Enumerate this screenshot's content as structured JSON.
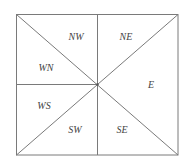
{
  "diagram": {
    "type": "compass-region-partition",
    "frame": {
      "left": 16,
      "top": 14,
      "right": 178,
      "bottom": 155
    },
    "center": {
      "x": 97,
      "y": 85
    },
    "line_color": "#7a7a7a",
    "text_color": "#444444",
    "regions": [
      {
        "id": "nw",
        "label": "NW",
        "x": 76,
        "y": 40
      },
      {
        "id": "ne",
        "label": "NE",
        "x": 126,
        "y": 40
      },
      {
        "id": "wn",
        "label": "WN",
        "x": 46,
        "y": 71
      },
      {
        "id": "e",
        "label": "E",
        "x": 151,
        "y": 88
      },
      {
        "id": "ws",
        "label": "WS",
        "x": 44,
        "y": 109
      },
      {
        "id": "sw",
        "label": "SW",
        "x": 75,
        "y": 133
      },
      {
        "id": "se",
        "label": "SE",
        "x": 122,
        "y": 133
      }
    ]
  }
}
